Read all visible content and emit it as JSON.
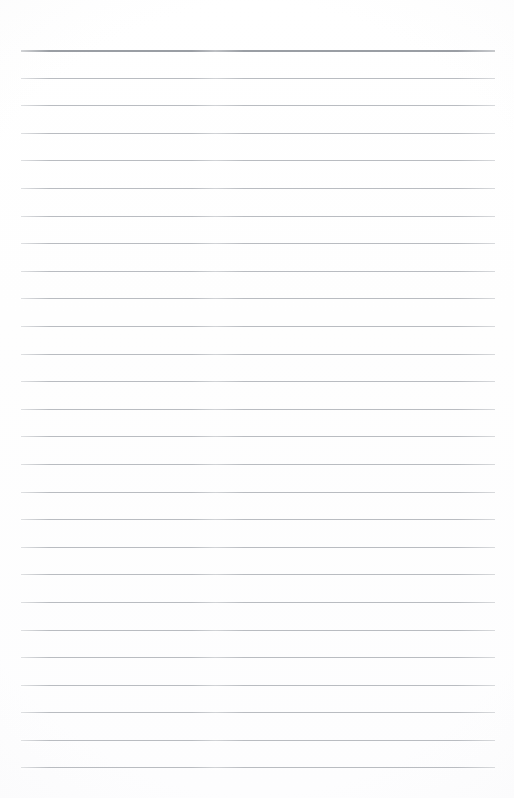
{
  "document": {
    "type": "lined-notepaper",
    "title": "",
    "body_text": "",
    "background_color": "#ffffff",
    "page_width": 514,
    "page_height": 798
  },
  "ruling": {
    "line_count": 27,
    "first_line_y": 50,
    "line_spacing": 27.58,
    "left_margin_x": 21,
    "right_margin_x": 495,
    "line_color": "#b9bcc1",
    "header_rule_color": "#9a9ea4",
    "header_rule_thickness": 2,
    "line_thickness": 1,
    "has_vertical_margin_rule": false,
    "top_blank_margin": 50,
    "bottom_blank_margin": 31
  },
  "lines": [
    {
      "index": 1,
      "y": 50,
      "is_header": true,
      "content": ""
    },
    {
      "index": 2,
      "y": 78,
      "is_header": false,
      "content": ""
    },
    {
      "index": 3,
      "y": 105,
      "is_header": false,
      "content": ""
    },
    {
      "index": 4,
      "y": 133,
      "is_header": false,
      "content": ""
    },
    {
      "index": 5,
      "y": 160,
      "is_header": false,
      "content": ""
    },
    {
      "index": 6,
      "y": 188,
      "is_header": false,
      "content": ""
    },
    {
      "index": 7,
      "y": 216,
      "is_header": false,
      "content": ""
    },
    {
      "index": 8,
      "y": 243,
      "is_header": false,
      "content": ""
    },
    {
      "index": 9,
      "y": 271,
      "is_header": false,
      "content": ""
    },
    {
      "index": 10,
      "y": 298,
      "is_header": false,
      "content": ""
    },
    {
      "index": 11,
      "y": 326,
      "is_header": false,
      "content": ""
    },
    {
      "index": 12,
      "y": 354,
      "is_header": false,
      "content": ""
    },
    {
      "index": 13,
      "y": 381,
      "is_header": false,
      "content": ""
    },
    {
      "index": 14,
      "y": 409,
      "is_header": false,
      "content": ""
    },
    {
      "index": 15,
      "y": 436,
      "is_header": false,
      "content": ""
    },
    {
      "index": 16,
      "y": 464,
      "is_header": false,
      "content": ""
    },
    {
      "index": 17,
      "y": 492,
      "is_header": false,
      "content": ""
    },
    {
      "index": 18,
      "y": 519,
      "is_header": false,
      "content": ""
    },
    {
      "index": 19,
      "y": 547,
      "is_header": false,
      "content": ""
    },
    {
      "index": 20,
      "y": 574,
      "is_header": false,
      "content": ""
    },
    {
      "index": 21,
      "y": 602,
      "is_header": false,
      "content": ""
    },
    {
      "index": 22,
      "y": 630,
      "is_header": false,
      "content": ""
    },
    {
      "index": 23,
      "y": 657,
      "is_header": false,
      "content": ""
    },
    {
      "index": 24,
      "y": 685,
      "is_header": false,
      "content": ""
    },
    {
      "index": 25,
      "y": 712,
      "is_header": false,
      "content": ""
    },
    {
      "index": 26,
      "y": 740,
      "is_header": false,
      "content": ""
    },
    {
      "index": 27,
      "y": 767,
      "is_header": false,
      "content": ""
    }
  ]
}
